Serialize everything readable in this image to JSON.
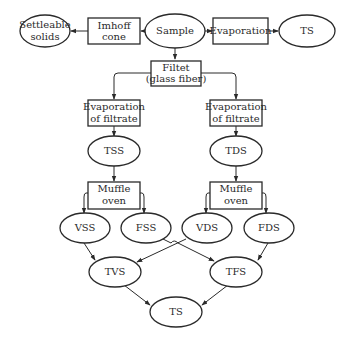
{
  "diagram": {
    "type": "flowchart",
    "title": "",
    "nodes": {
      "sample": {
        "label": "Sample",
        "shape": "ellipse"
      },
      "imhoff": {
        "label_1": "Imhoff",
        "label_2": "cone",
        "shape": "rect"
      },
      "settleable": {
        "label_1": "Settleable",
        "label_2": "solids",
        "shape": "ellipse"
      },
      "evaporation": {
        "label": "Evaporation",
        "shape": "rect"
      },
      "ts_top": {
        "label": "TS",
        "shape": "ellipse"
      },
      "filter": {
        "label_1": "Filtet",
        "label_2": "(glass fiber)",
        "shape": "rect"
      },
      "evap_left": {
        "label_1": "Evaporation",
        "label_2": "of filtrate",
        "shape": "rect"
      },
      "evap_right": {
        "label_1": "Evaporation",
        "label_2": "of filtrate",
        "shape": "rect"
      },
      "tss": {
        "label": "TSS",
        "shape": "ellipse"
      },
      "tds": {
        "label": "TDS",
        "shape": "ellipse"
      },
      "muffle_left": {
        "label_1": "Muffle",
        "label_2": "oven",
        "shape": "rect"
      },
      "muffle_right": {
        "label_1": "Muffle",
        "label_2": "oven",
        "shape": "rect"
      },
      "vss": {
        "label": "VSS",
        "shape": "ellipse"
      },
      "fss": {
        "label": "FSS",
        "shape": "ellipse"
      },
      "vds": {
        "label": "VDS",
        "shape": "ellipse"
      },
      "fds": {
        "label": "FDS",
        "shape": "ellipse"
      },
      "tvs": {
        "label": "TVS",
        "shape": "ellipse"
      },
      "tfs": {
        "label": "TFS",
        "shape": "ellipse"
      },
      "ts_bottom": {
        "label": "TS",
        "shape": "ellipse"
      }
    },
    "edges": [
      {
        "from": "sample",
        "to": "imhoff"
      },
      {
        "from": "imhoff",
        "to": "settleable"
      },
      {
        "from": "sample",
        "to": "evaporation"
      },
      {
        "from": "evaporation",
        "to": "ts_top"
      },
      {
        "from": "sample",
        "to": "filter"
      },
      {
        "from": "filter",
        "to": "evap_left"
      },
      {
        "from": "filter",
        "to": "evap_right"
      },
      {
        "from": "evap_left",
        "to": "tss"
      },
      {
        "from": "evap_right",
        "to": "tds"
      },
      {
        "from": "tss",
        "to": "muffle_left"
      },
      {
        "from": "tds",
        "to": "muffle_right"
      },
      {
        "from": "muffle_left",
        "to": "vss"
      },
      {
        "from": "muffle_left",
        "to": "fss"
      },
      {
        "from": "muffle_right",
        "to": "vds"
      },
      {
        "from": "muffle_right",
        "to": "fds"
      },
      {
        "from": "vss",
        "to": "tvs"
      },
      {
        "from": "vds",
        "to": "tvs"
      },
      {
        "from": "fss",
        "to": "tfs"
      },
      {
        "from": "fds",
        "to": "tfs"
      },
      {
        "from": "tvs",
        "to": "ts_bottom"
      },
      {
        "from": "tfs",
        "to": "ts_bottom"
      }
    ],
    "colors": {
      "stroke": "#2a2a2a",
      "background": "#ffffff"
    }
  }
}
